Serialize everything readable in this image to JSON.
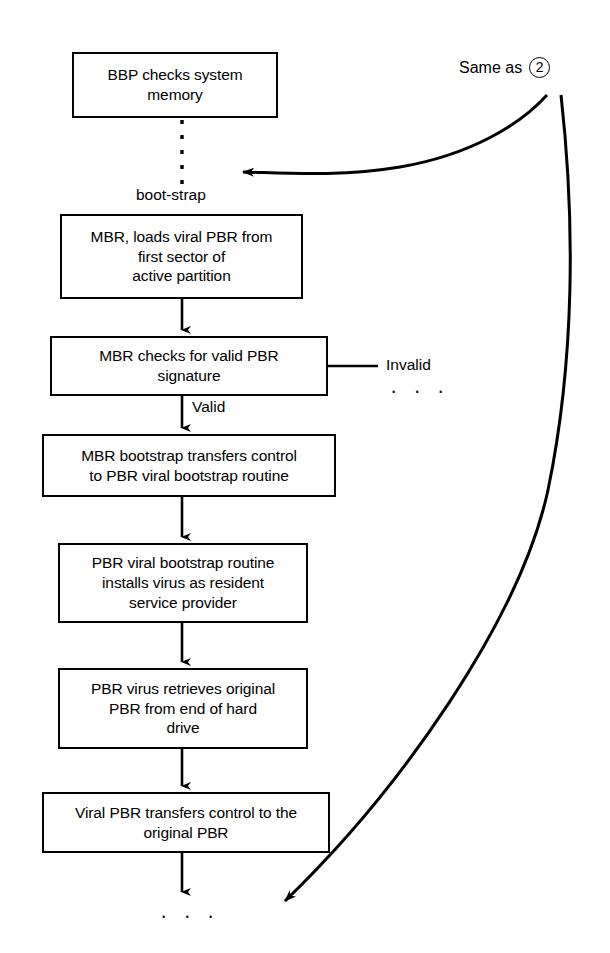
{
  "diagram": {
    "stroke_color": "#000000",
    "background_color": "#ffffff",
    "nodes": [
      {
        "id": "bbp",
        "label": "BBP checks system\nmemory"
      },
      {
        "id": "mbr_loads",
        "label": "MBR, loads viral PBR from\nfirst sector of\nactive partition"
      },
      {
        "id": "mbr_checks",
        "label": "MBR checks for valid PBR\nsignature"
      },
      {
        "id": "mbr_transfer",
        "label": "MBR bootstrap transfers control\nto PBR viral bootstrap routine"
      },
      {
        "id": "pbr_install",
        "label": "PBR viral bootstrap routine\ninstalls virus as resident\nservice provider"
      },
      {
        "id": "pbr_retrieve",
        "label": "PBR virus retrieves original\nPBR from end of hard\ndrive"
      },
      {
        "id": "viral_xfer",
        "label": "Viral PBR transfers control to the\noriginal PBR"
      }
    ],
    "edge_labels": {
      "bootstrap": "boot-strap",
      "valid": "Valid",
      "invalid": "Invalid"
    },
    "reference": {
      "text": "Same as",
      "number": "2"
    },
    "ellipsis": {
      "invalid_branch": "· · ·",
      "bottom": "· · ·"
    }
  }
}
